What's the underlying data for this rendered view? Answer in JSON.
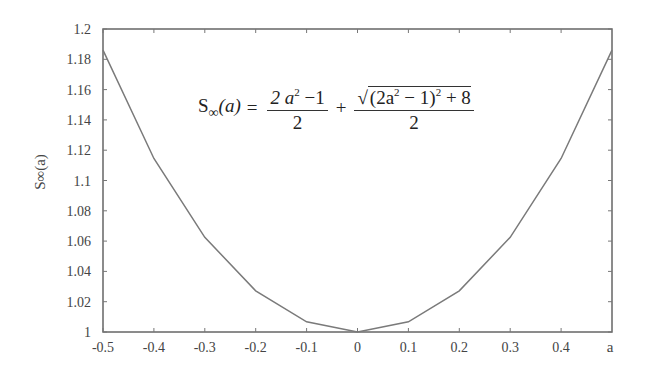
{
  "chart_data": {
    "type": "line",
    "title": "",
    "xlabel": "a",
    "ylabel": "S∞(a)",
    "xlim": [
      -0.5,
      0.5
    ],
    "ylim": [
      1.0,
      1.2
    ],
    "grid": false,
    "x_ticks": [
      -0.5,
      -0.4,
      -0.3,
      -0.2,
      -0.1,
      0,
      0.1,
      0.2,
      0.3,
      0.4
    ],
    "x_tick_labels": [
      "-0.5",
      "-0.4",
      "-0.3",
      "-0.2",
      "-0.1",
      "0",
      "0.1",
      "0.2",
      "0.3",
      "0.4",
      "a"
    ],
    "y_ticks": [
      1.0,
      1.02,
      1.04,
      1.06,
      1.08,
      1.1,
      1.12,
      1.14,
      1.16,
      1.18,
      1.2
    ],
    "y_tick_labels": [
      "1",
      "1.02",
      "1.04",
      "1.06",
      "1.08",
      "1.1",
      "1.12",
      "1.14",
      "1.16",
      "1.18",
      "1.2"
    ],
    "series": [
      {
        "name": "S∞(a)",
        "x": [
          -0.5,
          -0.4,
          -0.3,
          -0.2,
          -0.1,
          0.0,
          0.1,
          0.2,
          0.3,
          0.4,
          0.5
        ],
        "values": [
          1.1861,
          1.1145,
          1.0625,
          1.0272,
          1.0067,
          1.0,
          1.0067,
          1.0272,
          1.0625,
          1.1145,
          1.1861
        ],
        "color": "#7a7a7a"
      }
    ],
    "annotations": [
      {
        "text": "S∞(a) = (2a² − 1)/2 + √((2a² − 1)² + 8)/2"
      }
    ]
  },
  "formula": {
    "lhs_s": "S",
    "lhs_sub": "∞",
    "lhs_arg": "(a)",
    "eq": "=",
    "frac1_num_a": "2 a",
    "frac1_num_exp": "2",
    "frac1_num_rest": " −1",
    "frac1_den": "2",
    "plus": "+",
    "frac2_num_pre": "(2a",
    "frac2_num_exp": "2",
    "frac2_num_mid": " − 1)",
    "frac2_num_exp2": "2",
    "frac2_num_post": " + 8",
    "frac2_den": "2",
    "radical": "√"
  }
}
